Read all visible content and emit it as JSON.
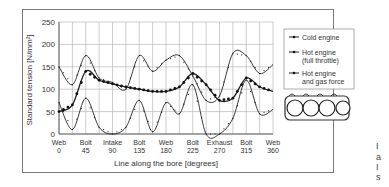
{
  "chart_data": {
    "type": "line",
    "title": "",
    "xlabel": "Line along the bore [degrees]",
    "ylabel": "Standard tension [N/mm²]",
    "ylim": [
      0,
      250
    ],
    "xlim": [
      0,
      360
    ],
    "yticks": [
      0,
      50,
      100,
      150,
      200,
      250
    ],
    "xticks": [
      {
        "value": 0,
        "name": "Web",
        "deg": "0"
      },
      {
        "value": 45,
        "name": "Bolt",
        "deg": "45"
      },
      {
        "value": 90,
        "name": "Intake",
        "deg": "90"
      },
      {
        "value": 135,
        "name": "Bolt",
        "deg": "135"
      },
      {
        "value": 180,
        "name": "Web",
        "deg": "180"
      },
      {
        "value": 225,
        "name": "Bolt",
        "deg": "225"
      },
      {
        "value": 270,
        "name": "Exhaust",
        "deg": "270"
      },
      {
        "value": 315,
        "name": "Bolt",
        "deg": "315"
      },
      {
        "value": 360,
        "name": "Web",
        "deg": "360"
      }
    ],
    "grid": true,
    "legend_position": "right",
    "x": [
      0,
      22.5,
      45,
      67.5,
      90,
      112.5,
      135,
      157.5,
      180,
      202.5,
      225,
      247.5,
      270,
      292.5,
      315,
      337.5,
      360
    ],
    "series": [
      {
        "name": "Cold engine",
        "marker": "dot",
        "values": [
          50,
          65,
          140,
          120,
          112,
          105,
          100,
          95,
          95,
          105,
          135,
          110,
          75,
          80,
          125,
          105,
          95
        ]
      },
      {
        "name": "Hot engine (full throttle)",
        "marker": "line",
        "values": [
          150,
          110,
          175,
          125,
          115,
          100,
          175,
          140,
          165,
          175,
          130,
          75,
          85,
          180,
          175,
          135,
          155
        ]
      },
      {
        "name": "Hot engine and gas force",
        "marker": "line",
        "values": [
          70,
          10,
          80,
          15,
          0,
          15,
          75,
          5,
          70,
          45,
          110,
          0,
          0,
          35,
          120,
          45,
          55
        ]
      }
    ]
  },
  "side_text": [
    "I",
    "a",
    "I",
    "s"
  ]
}
